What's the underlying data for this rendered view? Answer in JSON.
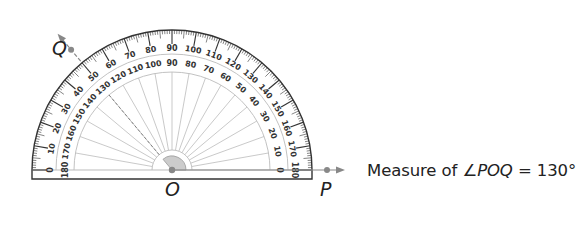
{
  "diagram": {
    "type": "protractor",
    "points": {
      "vertex": "O",
      "arm_p": "P",
      "arm_q": "Q"
    },
    "angle_degrees": 130,
    "outer_scale": {
      "direction": "left-to-right",
      "labels": [
        "0",
        "10",
        "20",
        "30",
        "40",
        "50",
        "60",
        "70",
        "80",
        "90",
        "100",
        "110",
        "120",
        "130",
        "140",
        "150",
        "160",
        "170",
        "180"
      ]
    },
    "inner_scale": {
      "direction": "right-to-left",
      "labels": [
        "180",
        "170",
        "160",
        "150",
        "140",
        "130",
        "120",
        "110",
        "100",
        "90",
        "80",
        "70",
        "60",
        "50",
        "40",
        "30",
        "20",
        "10",
        "0"
      ]
    },
    "caption": {
      "prefix": "Measure of ",
      "angle_symbol": "∠",
      "angle_name": "POQ",
      "equals": " = ",
      "value": "130°"
    },
    "colors": {
      "ink": "#333333",
      "ray": "#888888",
      "shade": "#cccccc",
      "guide": "#bbbbbb"
    }
  }
}
